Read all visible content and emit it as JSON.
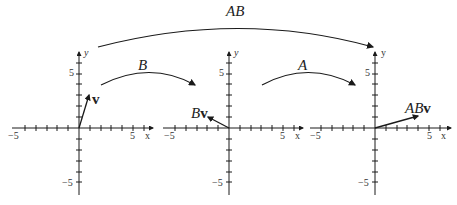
{
  "diagram": {
    "arrows": [
      {
        "label": "AB",
        "from_plot": 0,
        "to_plot": 2
      },
      {
        "label": "B",
        "from_plot": 0,
        "to_plot": 1
      },
      {
        "label": "A",
        "from_plot": 1,
        "to_plot": 2
      }
    ],
    "plots": [
      {
        "vector_label_pre": "",
        "vector_label_bold": "v",
        "vector": [
          1,
          3
        ],
        "x_axis": "x",
        "y_axis": "y",
        "tick_min": "−5",
        "tick_max": "5"
      },
      {
        "vector_label_pre": "B",
        "vector_label_bold": "v",
        "vector": [
          -2,
          1
        ],
        "x_axis": "x",
        "y_axis": "y",
        "tick_min": "−5",
        "tick_max": "5"
      },
      {
        "vector_label_pre": "AB",
        "vector_label_bold": "v",
        "vector": [
          4,
          1
        ],
        "x_axis": "x",
        "y_axis": "y",
        "tick_min": "−5",
        "tick_max": "5"
      }
    ],
    "axis_range": [
      -6,
      6
    ],
    "colors": {
      "ink": "#1a1a1a"
    }
  }
}
